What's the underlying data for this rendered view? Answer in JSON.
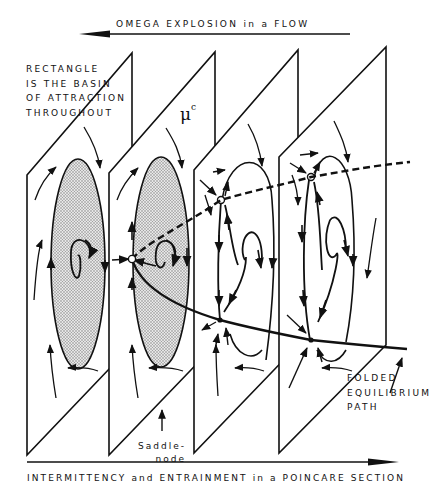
{
  "titles": {
    "top_arrow_label": "OMEGA EXPLOSION in a FLOW",
    "bottom_arrow_label": "INTERMITTENCY and ENTRAINMENT in a POINCARE SECTION"
  },
  "annotations": {
    "basin_note": "RECTANGLE\nIS THE BASIN\nOF ATTRACTION\nTHROUGHOUT",
    "mu_symbol": "μ",
    "mu_superscript": "c",
    "saddle_node": "Saddle-\nnode",
    "folded_path": "FOLDED\nEQUILIBRIUM\nPATH"
  },
  "planes": [
    {
      "index": 1,
      "description": "single attracting focus inside shaded elliptic basin",
      "shaded": true
    },
    {
      "index": 2,
      "description": "saddle-node point appears at edge of shaded basin",
      "shaded": true
    },
    {
      "index": 3,
      "description": "saddle and node separated, spiral focus, no shading",
      "shaded": false
    },
    {
      "index": 4,
      "description": "saddle and node further separated, spiral focus, no shading",
      "shaded": false
    }
  ],
  "colors": {
    "ink": "#111111",
    "shading": "#c8c8c8",
    "background": "#ffffff"
  }
}
